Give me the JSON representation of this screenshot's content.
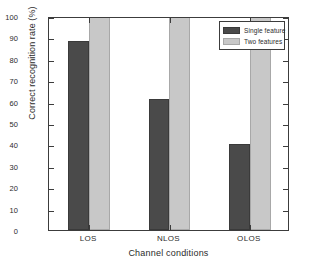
{
  "chart_data": {
    "type": "bar",
    "title": "",
    "categories": [
      "LOS",
      "NLOS",
      "OLOS"
    ],
    "series": [
      {
        "name": "Single feature",
        "values": [
          88.3,
          61.2,
          40.2
        ],
        "color": "#4a4a4a"
      },
      {
        "name": "Two features",
        "values": [
          100,
          100,
          100
        ],
        "color": "#c8c8c8"
      }
    ],
    "xlabel": "Channel conditions",
    "ylabel": "Correct recognition rate (%)",
    "ylim": [
      0,
      100
    ],
    "yticks": [
      0,
      10,
      20,
      30,
      40,
      50,
      60,
      70,
      80,
      90,
      100
    ],
    "ytick_labels": [
      "0",
      "10",
      "20",
      "30",
      "40",
      "50",
      "60",
      "70",
      "80",
      "90",
      "100"
    ],
    "grid": false,
    "legend_position": "upper right"
  }
}
